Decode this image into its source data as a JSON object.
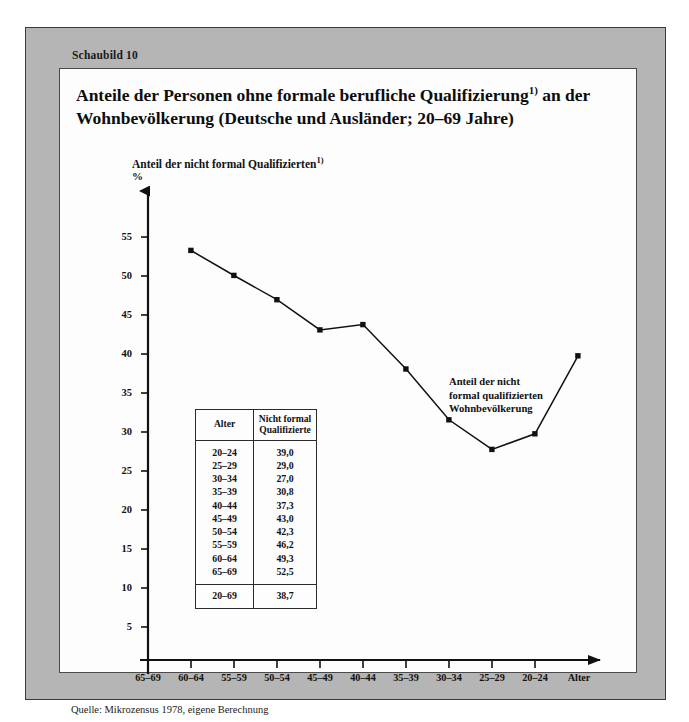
{
  "figure_label": "Schaubild 10",
  "title_line1": "Anteile der Personen ohne formale berufliche Qualifizierung",
  "title_sup1": "1)",
  "title_line1b": " an der",
  "title_line2": "Wohnbevölkerung  (Deutsche und Ausländer; 20–69 Jahre)",
  "axis_caption": "Anteil der nicht formal Qualifizierten",
  "axis_caption_sup": "1)",
  "percent_symbol": "%",
  "annotation": "Anteil der nicht\nformal qualifizierten\nWohnbevölkerung",
  "annotation_l1": "Anteil der nicht",
  "annotation_l2": "formal qualifizierten",
  "annotation_l3": "Wohnbevölkerung",
  "source": "Quelle: Mikrozensus 1978, eigene Berechnung",
  "footnote": "1) D. h.: ohne anerkannten beruflichen Ausbildungsabschluß",
  "table": {
    "header_col1": "Alter",
    "header_col2_l1": "Nicht formal",
    "header_col2_l2": "Qualifizierte",
    "rows": [
      {
        "age": "20–24",
        "value": "39,0"
      },
      {
        "age": "25–29",
        "value": "29,0"
      },
      {
        "age": "30–34",
        "value": "27,0"
      },
      {
        "age": "35–39",
        "value": "30,8"
      },
      {
        "age": "40–44",
        "value": "37,3"
      },
      {
        "age": "45–49",
        "value": "43,0"
      },
      {
        "age": "50–54",
        "value": "42,3"
      },
      {
        "age": "55–59",
        "value": "46,2"
      },
      {
        "age": "60–64",
        "value": "49,3"
      },
      {
        "age": "65–69",
        "value": "52,5"
      }
    ],
    "total": {
      "age": "20–69",
      "value": "38,7"
    }
  },
  "chart_data": {
    "type": "line",
    "xlabel": "Alter",
    "ylabel": "Anteil der nicht formal Qualifizierten (%)",
    "categories": [
      "65–69",
      "60–64",
      "55–59",
      "50–54",
      "45–49",
      "40–44",
      "35–39",
      "30–34",
      "25–29",
      "20–24"
    ],
    "values": [
      52.5,
      49.3,
      46.2,
      42.3,
      43.0,
      37.3,
      30.8,
      27.0,
      29.0,
      39.0
    ],
    "series": [
      {
        "name": "Anteil der nicht formal qualifizierten Wohnbevölkerung",
        "values": [
          52.5,
          49.3,
          46.2,
          42.3,
          43.0,
          37.3,
          30.8,
          27.0,
          29.0,
          39.0
        ]
      }
    ],
    "ylim": [
      0,
      58
    ],
    "yticks": [
      5,
      10,
      15,
      20,
      25,
      30,
      35,
      40,
      45,
      50,
      55
    ],
    "ytick_labels": [
      "5",
      "10",
      "15",
      "20",
      "25",
      "30",
      "35",
      "40",
      "45",
      "50",
      "55"
    ],
    "xtick_labels": [
      "65–69",
      "60–64",
      "55–59",
      "50–54",
      "45–49",
      "40–44",
      "35–39",
      "30–34",
      "25–29",
      "20–24",
      "Alter"
    ],
    "grid": false,
    "legend": "none",
    "marker": "square",
    "line_color": "#111111",
    "total_20_69": 38.7
  },
  "colors": {
    "page_background": "#b5b5b5",
    "panel_background": "#fdfdfd",
    "ink": "#111111",
    "border": "#3a3a3a"
  }
}
